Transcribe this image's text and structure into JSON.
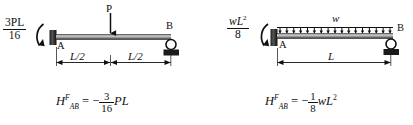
{
  "figure": {
    "background_color": "#ffffff",
    "ink_color": "#1a1a1a",
    "caption_kind": "fixed-end-moment-diagrams"
  },
  "left": {
    "name": "simply-supported-point-load-midspan",
    "moment_label": {
      "numerator": "3PL",
      "denominator": "16"
    },
    "support_a_label": "A",
    "support_b_label": "B",
    "load_label": "P",
    "load_type": "point-load",
    "dimensions": [
      {
        "label": "L/2"
      },
      {
        "label": "L/2"
      }
    ],
    "result": {
      "symbol": "H",
      "superscript": "F",
      "subscript": "AB",
      "equals": "=",
      "sign": "−",
      "numerator": "3",
      "denominator": "16",
      "term": "PL"
    }
  },
  "right": {
    "name": "simply-supported-uniform-load",
    "moment_label": {
      "numerator": "wL",
      "numerator_exponent": "2",
      "denominator": "8"
    },
    "support_a_label": "A",
    "support_b_label": "B",
    "load_label": "w",
    "load_type": "uniformly-distributed-load",
    "load_arrow_count": 17,
    "dimensions": [
      {
        "label": "L"
      }
    ],
    "result": {
      "symbol": "H",
      "superscript": "F",
      "subscript": "AB",
      "equals": "=",
      "sign": "−",
      "numerator": "1",
      "denominator": "8",
      "term": "wL",
      "term_exponent": "2"
    }
  }
}
